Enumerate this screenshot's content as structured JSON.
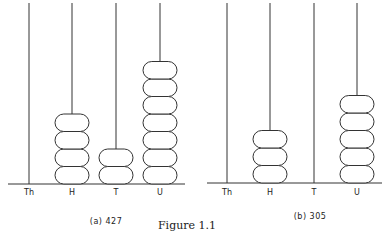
{
  "figure_title": "Figure 1.1",
  "panels": [
    {
      "caption": "(a) 427",
      "value": 427,
      "rods": [
        {
          "label": "Th",
          "beads": 0
        },
        {
          "label": "H",
          "beads": 4
        },
        {
          "label": "T",
          "beads": 2
        },
        {
          "label": "U",
          "beads": 7
        }
      ]
    },
    {
      "caption": "(b) 305",
      "value": 305,
      "rods": [
        {
          "label": "Th",
          "beads": 0
        },
        {
          "label": "H",
          "beads": 3
        },
        {
          "label": "T",
          "beads": 0
        },
        {
          "label": "U",
          "beads": 5
        }
      ]
    }
  ]
}
